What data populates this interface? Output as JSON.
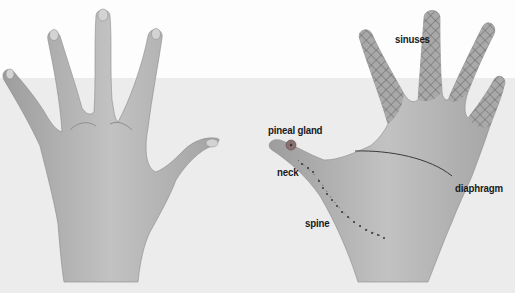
{
  "figure": {
    "left_panel": {
      "description": "back of right hand, fingers spread"
    },
    "right_panel": {
      "description": "palm of hand with reflexology zones"
    }
  },
  "labels": {
    "sinuses": "sinuses",
    "pineal_gland": "pineal gland",
    "neck": "neck",
    "diaphragm": "diaphragm",
    "spine": "spine"
  },
  "colors": {
    "skin": "#b9b9b9",
    "skin_shadow": "#9a9a9a",
    "crosshatch": "#5a5a5a",
    "line": "#3a3a3a",
    "bg_top": "#fdfdfd",
    "bg_bottom": "#ececec"
  }
}
